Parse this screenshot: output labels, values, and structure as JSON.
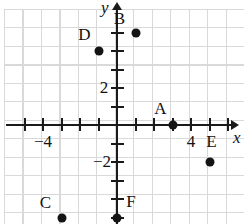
{
  "figure": {
    "type": "coordinate-plane",
    "title": "",
    "axes": {
      "x_name": "x",
      "y_name": "y",
      "x_labels": [
        {
          "text": "−4",
          "value": -4,
          "px": 43,
          "py": 142
        },
        {
          "text": "4",
          "value": 4,
          "px": 191,
          "py": 142
        }
      ],
      "y_labels": [
        {
          "text": "2",
          "value": 2,
          "px": 104,
          "py": 88
        },
        {
          "text": "−2",
          "value": -2,
          "px": 102,
          "py": 162
        }
      ],
      "x_range": [
        -6,
        6
      ],
      "y_range": [
        -6,
        5
      ],
      "tick_spacing_units": 1,
      "grid": true,
      "grid_color": "#d9d9d9",
      "axis_color": "#1a1a1a"
    },
    "points": [
      {
        "label": "A",
        "x": 3,
        "y": 0,
        "label_dx": -12,
        "label_dy": -16
      },
      {
        "label": "B",
        "x": 1,
        "y": 5,
        "label_dx": -16,
        "label_dy": -14
      },
      {
        "label": "C",
        "x": -3,
        "y": -5,
        "label_dx": -16,
        "label_dy": -15
      },
      {
        "label": "D",
        "x": -1,
        "y": 4,
        "label_dx": -14,
        "label_dy": -16
      },
      {
        "label": "E",
        "x": 5,
        "y": -2,
        "label_dx": 2,
        "label_dy": -20
      },
      {
        "label": "F",
        "x": 0,
        "y": -5,
        "label_dx": 14,
        "label_dy": -16
      }
    ],
    "chart_data": {
      "type": "scatter",
      "title": "",
      "xlabel": "x",
      "ylabel": "y",
      "xlim": [
        -6,
        6
      ],
      "ylim": [
        -6,
        5
      ],
      "grid": true,
      "categories": [
        "A",
        "B",
        "C",
        "D",
        "E",
        "F"
      ],
      "series": [
        {
          "name": "plotted points",
          "points": [
            {
              "name": "A",
              "x": 3,
              "y": 0
            },
            {
              "name": "B",
              "x": 1,
              "y": 5
            },
            {
              "name": "C",
              "x": -3,
              "y": -5
            },
            {
              "name": "D",
              "x": -1,
              "y": 4
            },
            {
              "name": "E",
              "x": 5,
              "y": -2
            },
            {
              "name": "F",
              "x": 0,
              "y": -5
            }
          ]
        }
      ],
      "xticks": [
        -4,
        4
      ],
      "yticks": [
        2,
        -2
      ],
      "xtick_labels": [
        "−4",
        "4"
      ],
      "ytick_labels": [
        "2",
        "−2"
      ]
    }
  },
  "geometry": {
    "origin_px": 117,
    "origin_py": 125,
    "unit_px": 18.5
  }
}
